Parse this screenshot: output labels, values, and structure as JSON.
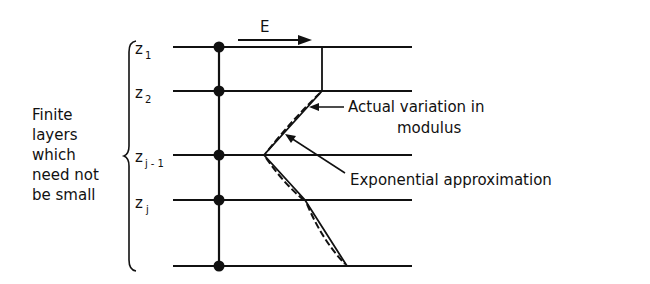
{
  "diagram": {
    "arrow_label": "E",
    "side_label_lines": [
      "Finite",
      "layers",
      "which",
      "need not",
      "be small"
    ],
    "layers": [
      {
        "name": "z",
        "sub": "1"
      },
      {
        "name": "z",
        "sub": "2"
      },
      {
        "name": "z",
        "sub": "j - 1"
      },
      {
        "name": "z",
        "sub": "j"
      }
    ],
    "annotations": {
      "actual_line1": "Actual variation in",
      "actual_line2": "modulus",
      "exponential": "Exponential approximation"
    },
    "colors": {
      "ink": "#111111",
      "background": "#ffffff"
    }
  }
}
